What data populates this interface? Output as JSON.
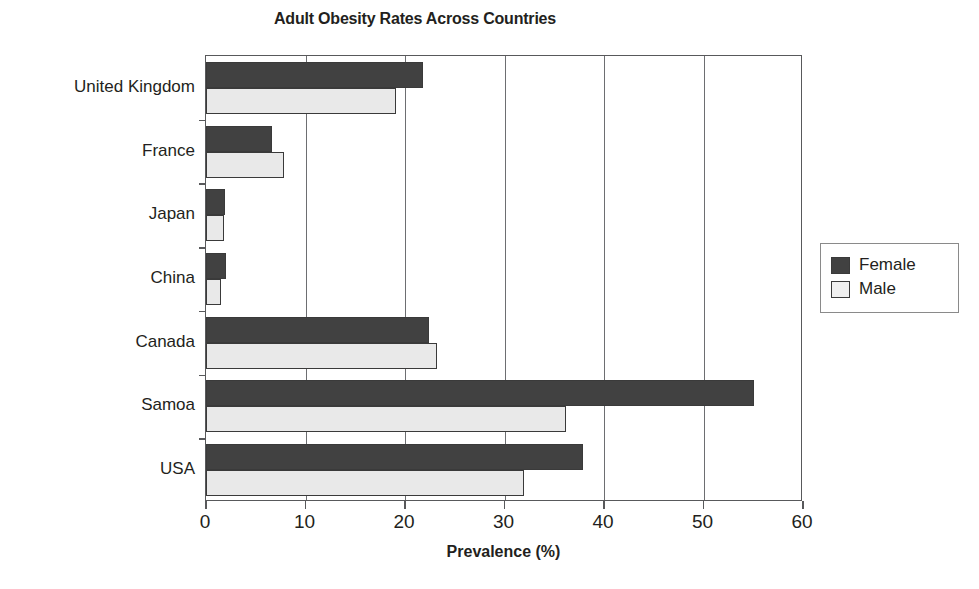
{
  "chart_data": {
    "type": "bar",
    "orientation": "horizontal",
    "title": "Adult Obesity Rates Across Countries",
    "xlabel": "Prevalence (%)",
    "ylabel": "",
    "xlim": [
      0,
      60
    ],
    "xticks": [
      0,
      10,
      20,
      30,
      40,
      50,
      60
    ],
    "xtick_labels": [
      "0",
      "10",
      "20",
      "30",
      "40",
      "50",
      "60"
    ],
    "grid": true,
    "grid_axis": "x",
    "legend_position": "right",
    "categories": [
      "United Kingdom",
      "France",
      "Japan",
      "China",
      "Canada",
      "Samoa",
      "USA"
    ],
    "series": [
      {
        "name": "Female",
        "color": "#414141",
        "values": [
          21.8,
          6.6,
          1.9,
          2.0,
          22.4,
          55.1,
          37.9
        ]
      },
      {
        "name": "Male",
        "color": "#e9e9e9",
        "values": [
          19.1,
          7.8,
          1.8,
          1.5,
          23.2,
          36.2,
          32.0
        ]
      }
    ]
  },
  "legend": {
    "items": [
      {
        "label": "Female",
        "swatch": "female"
      },
      {
        "label": "Male",
        "swatch": "male"
      }
    ]
  },
  "colors": {
    "female_bar": "#414141",
    "male_bar": "#e9e9e9",
    "axis": "#58595b",
    "gridline": "#6d6e71",
    "text": "#231f20"
  }
}
